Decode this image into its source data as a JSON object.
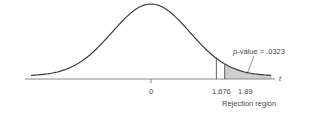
{
  "chart_data": {
    "type": "area",
    "title": "",
    "xlabel": "t",
    "ylabel": "",
    "x_ticks": [
      {
        "value": 0,
        "label": "0"
      },
      {
        "value": 1.676,
        "label": "1.676"
      },
      {
        "value": 1.89,
        "label": "1.89"
      }
    ],
    "critical_value": 1.676,
    "test_statistic": 1.89,
    "p_value": 0.0323,
    "shaded_region": {
      "from": 1.89,
      "to": "inf",
      "label": "p-value = .0323"
    },
    "rejection_region": {
      "from": 1.676,
      "to": "inf",
      "label": "Rejection region"
    },
    "x_range": [
      -4,
      4
    ],
    "grid": false,
    "legend": false
  },
  "labels": {
    "axis_variable": "t",
    "tick_zero": "0",
    "tick_critical": "1.676",
    "tick_statistic": "1.89",
    "pvalue_prefix": "p",
    "pvalue_rest": "-value = .0323",
    "rejection": "Rejection region"
  },
  "colors": {
    "curve": "#3a3a3a",
    "axis": "#8a8a8a",
    "shade": "#cfcfcf",
    "text": "#4a4a4a"
  }
}
